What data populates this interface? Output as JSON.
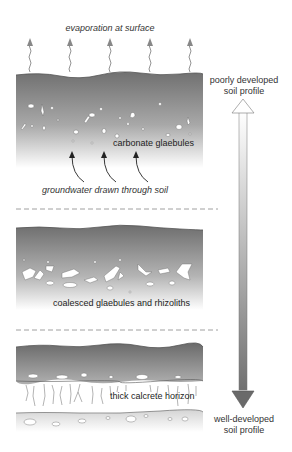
{
  "figure": {
    "top_label": "evaporation at surface",
    "stages": [
      {
        "id": "stage-1",
        "label": "carbonate glaebules"
      },
      {
        "id": "stage-2",
        "label": "coalesced glaebules and rhizoliths"
      },
      {
        "id": "stage-3",
        "label": "thick calcrete horizon"
      }
    ],
    "groundwater_label": "groundwater drawn through soil",
    "scale": {
      "top_line1": "poorly developed",
      "top_line2": "soil profile",
      "bottom_line1": "well-developed",
      "bottom_line2": "soil profile"
    },
    "colors": {
      "soil_dark": "#6f6f6f",
      "soil_light": "#ffffff",
      "arrow_gray": "#8a8a8a",
      "text": "#333333"
    }
  }
}
